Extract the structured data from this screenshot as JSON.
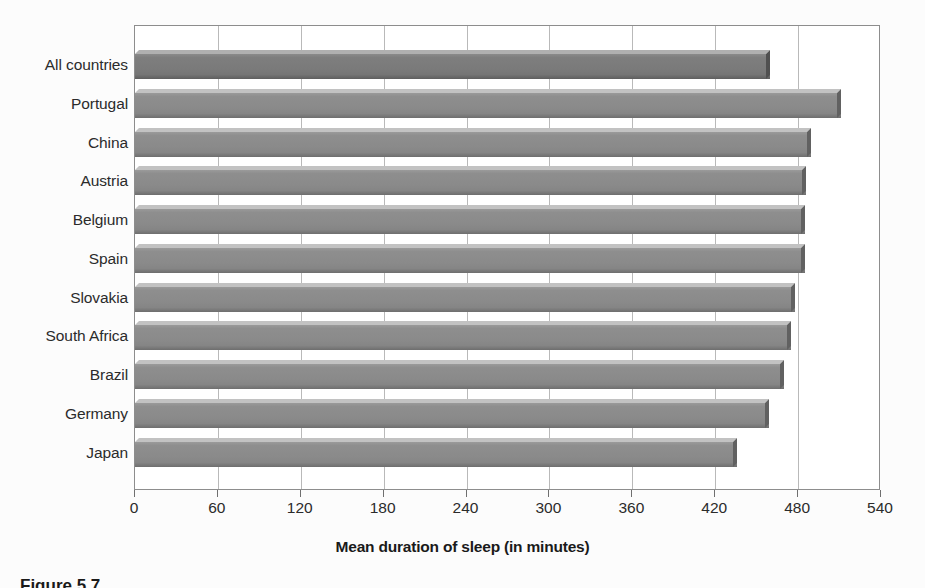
{
  "chart_data": {
    "type": "bar",
    "orientation": "horizontal",
    "title": "",
    "xlabel": "Mean duration of sleep (in minutes)",
    "ylabel": "",
    "xlim": [
      0,
      540
    ],
    "xticks": [
      0,
      60,
      120,
      180,
      240,
      300,
      360,
      420,
      480,
      540
    ],
    "xtick_labels": [
      "0",
      "60",
      "120",
      "180",
      "240",
      "300",
      "360",
      "420",
      "480",
      "540"
    ],
    "grid": true,
    "gridline_values": [
      60,
      120,
      180,
      240,
      300,
      360,
      420,
      480
    ],
    "legend": null,
    "categories": [
      "All countries",
      "Portugal",
      "China",
      "Austria",
      "Belgium",
      "Spain",
      "Slovakia",
      "South Africa",
      "Brazil",
      "Germany",
      "Japan"
    ],
    "values": [
      460,
      511,
      489,
      486,
      485,
      485,
      478,
      475,
      470,
      459,
      436
    ],
    "highlight_index": 0,
    "colors": {
      "bar": "#8a8a8a",
      "bar_highlight": "#7a7a7a",
      "bar_edge": "#5e5e5e",
      "plot_border": "#8d8d8d",
      "gridline": "#b9b9b9",
      "text": "#2b2b2b",
      "background": "#fcfcfc"
    }
  },
  "caption": {
    "text": "Figure 5.7"
  }
}
